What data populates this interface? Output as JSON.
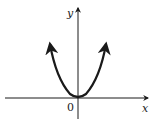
{
  "diagram": {
    "type": "function-graph",
    "function": "y = x^2",
    "curve": "parabola opening upward with vertex at origin, arrows on both ends",
    "labels": {
      "y_axis": "y",
      "x_axis": "x",
      "origin": "0"
    },
    "colors": {
      "stroke": "#1a1a1a",
      "background": "#ffffff"
    }
  }
}
